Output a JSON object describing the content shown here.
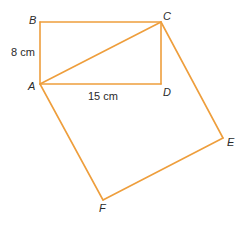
{
  "diagram": {
    "type": "geometry",
    "line_color": "#EE9E3C",
    "vertices": {
      "A": {
        "label": "A",
        "x": 40,
        "y": 84
      },
      "B": {
        "label": "B",
        "x": 40,
        "y": 22
      },
      "C": {
        "label": "C",
        "x": 161,
        "y": 22
      },
      "D": {
        "label": "D",
        "x": 161,
        "y": 84
      },
      "E": {
        "label": "E",
        "x": 223,
        "y": 138
      },
      "F": {
        "label": "F",
        "x": 103,
        "y": 200
      }
    },
    "shapes": [
      {
        "name": "rectangle-ABCD",
        "vertices": [
          "A",
          "B",
          "C",
          "D"
        ]
      },
      {
        "name": "square-ACEF",
        "vertices": [
          "A",
          "C",
          "E",
          "F"
        ]
      }
    ],
    "segments": [
      {
        "name": "diagonal-AC",
        "from": "A",
        "to": "C"
      }
    ],
    "measurements": {
      "AB": "8 cm",
      "AD": "15 cm"
    }
  }
}
